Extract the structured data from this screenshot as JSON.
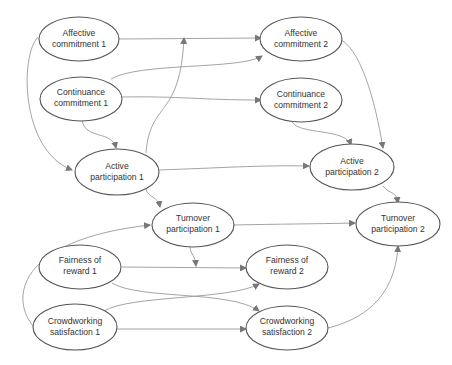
{
  "diagram": {
    "type": "path-model",
    "nodes": [
      {
        "id": "ac1",
        "line1": "Affective",
        "line2": "commitment 1",
        "cx": 79,
        "cy": 39
      },
      {
        "id": "ac2",
        "line1": "Affective",
        "line2": "commitment 2",
        "cx": 301,
        "cy": 39
      },
      {
        "id": "cc1",
        "line1": "Continuance",
        "line2": "commitment 1",
        "cx": 81,
        "cy": 99
      },
      {
        "id": "cc2",
        "line1": "Continuance",
        "line2": "commitment 2",
        "cx": 301,
        "cy": 100
      },
      {
        "id": "ap1",
        "line1": "Active",
        "line2": "participation 1",
        "cx": 117,
        "cy": 172
      },
      {
        "id": "ap2",
        "line1": "Active",
        "line2": "participation 2",
        "cx": 352,
        "cy": 167
      },
      {
        "id": "tp1",
        "line1": "Turnover",
        "line2": "participation 1",
        "cx": 193,
        "cy": 225
      },
      {
        "id": "tp2",
        "line1": "Turnover",
        "line2": "participation 2",
        "cx": 398,
        "cy": 224
      },
      {
        "id": "fr1",
        "line1": "Fairness of",
        "line2": "reward 1",
        "cx": 80,
        "cy": 267
      },
      {
        "id": "fr2",
        "line1": "Fairness of",
        "line2": "reward 2",
        "cx": 287,
        "cy": 267
      },
      {
        "id": "cs1",
        "line1": "Crowdworking",
        "line2": "satisfaction 1",
        "cx": 75,
        "cy": 327
      },
      {
        "id": "cs2",
        "line1": "Crowdworking",
        "line2": "satisfaction 2",
        "cx": 287,
        "cy": 328
      }
    ],
    "edges": [
      [
        "ac1",
        "ac2"
      ],
      [
        "ac1",
        "ap1"
      ],
      [
        "cc1",
        "ac2"
      ],
      [
        "cc1",
        "cc2"
      ],
      [
        "cc1",
        "ap1"
      ],
      [
        "ap1",
        "ac2"
      ],
      [
        "ap1",
        "ap2"
      ],
      [
        "ap1",
        "tp1"
      ],
      [
        "ac2",
        "ap2"
      ],
      [
        "cc2",
        "ap2"
      ],
      [
        "ap2",
        "tp2"
      ],
      [
        "tp1",
        "tp2"
      ],
      [
        "tp1",
        "fr2"
      ],
      [
        "fr1",
        "fr2"
      ],
      [
        "fr1",
        "cs2"
      ],
      [
        "cs1",
        "fr2"
      ],
      [
        "cs1",
        "cs2"
      ],
      [
        "cs1",
        "tp1"
      ],
      [
        "cs2",
        "tp2"
      ]
    ]
  }
}
